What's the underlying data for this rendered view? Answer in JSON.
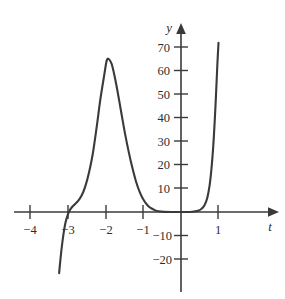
{
  "chart_data": {
    "type": "line",
    "title": "",
    "xlabel": "t",
    "ylabel": "y",
    "xlim": [
      -4.6,
      2.3
    ],
    "ylim": [
      -26,
      76
    ],
    "grid": false,
    "legend": null,
    "x_ticks": [
      -4,
      -3,
      -2,
      -1,
      1
    ],
    "x_tick_labels": [
      "−4",
      "−3",
      "−2",
      "−1",
      "1"
    ],
    "y_ticks": [
      70,
      60,
      50,
      40,
      30,
      20,
      10,
      -10,
      -20
    ],
    "y_tick_labels": [
      "70",
      "60",
      "50",
      "40",
      "30",
      "20",
      "10",
      "−10",
      "−20"
    ],
    "series": [
      {
        "name": "y(t)",
        "points": [
          [
            -3.25,
            -26.0
          ],
          [
            -3.22,
            -21.0
          ],
          [
            -3.18,
            -15.0
          ],
          [
            -3.13,
            -9.0
          ],
          [
            -3.08,
            -4.5
          ],
          [
            -3.02,
            -1.2
          ],
          [
            -2.97,
            0.6
          ],
          [
            -2.92,
            1.8
          ],
          [
            -2.85,
            3.0
          ],
          [
            -2.75,
            4.6
          ],
          [
            -2.65,
            7.0
          ],
          [
            -2.55,
            11.0
          ],
          [
            -2.45,
            17.0
          ],
          [
            -2.35,
            25.0
          ],
          [
            -2.25,
            36.0
          ],
          [
            -2.15,
            48.0
          ],
          [
            -2.05,
            58.0
          ],
          [
            -1.98,
            64.5
          ],
          [
            -1.92,
            65.0
          ],
          [
            -1.85,
            63.0
          ],
          [
            -1.78,
            58.5
          ],
          [
            -1.7,
            52.0
          ],
          [
            -1.6,
            43.0
          ],
          [
            -1.5,
            34.0
          ],
          [
            -1.4,
            26.0
          ],
          [
            -1.3,
            19.0
          ],
          [
            -1.2,
            13.0
          ],
          [
            -1.1,
            8.5
          ],
          [
            -1.0,
            5.2
          ],
          [
            -0.9,
            3.0
          ],
          [
            -0.8,
            1.6
          ],
          [
            -0.7,
            0.8
          ],
          [
            -0.6,
            0.3
          ],
          [
            -0.45,
            0.05
          ],
          [
            -0.2,
            0.0
          ],
          [
            0.1,
            0.0
          ],
          [
            0.3,
            0.1
          ],
          [
            0.45,
            0.5
          ],
          [
            0.55,
            1.4
          ],
          [
            0.63,
            3.0
          ],
          [
            0.7,
            6.0
          ],
          [
            0.76,
            11.0
          ],
          [
            0.81,
            18.0
          ],
          [
            0.86,
            28.0
          ],
          [
            0.9,
            39.0
          ],
          [
            0.94,
            52.0
          ],
          [
            0.97,
            63.0
          ],
          [
            1.0,
            72.0
          ]
        ]
      }
    ],
    "annotations": [],
    "colors": {
      "curve": "#3a3a3a",
      "axis": "#3a3a3a",
      "text": "#2d2d2d",
      "background": "#ffffff"
    }
  }
}
